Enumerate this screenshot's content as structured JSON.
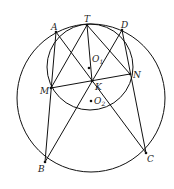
{
  "diagram": {
    "stroke_color": "#111111",
    "big_circle": {
      "name": "O2",
      "cx": 91,
      "cy": 98,
      "r": 74
    },
    "small_circle": {
      "name": "O1",
      "cx": 90,
      "cy": 67,
      "r": 43
    },
    "points": {
      "T": {
        "label": "T",
        "x": 87,
        "y": 25
      },
      "A": {
        "label": "A",
        "x": 56,
        "y": 32
      },
      "D": {
        "label": "D",
        "x": 122,
        "y": 30
      },
      "M": {
        "label": "M",
        "x": 51,
        "y": 88
      },
      "N": {
        "label": "N",
        "x": 130,
        "y": 74
      },
      "K": {
        "label": "K",
        "x": 92,
        "y": 81
      },
      "B": {
        "label": "B",
        "x": 45,
        "y": 162
      },
      "C": {
        "label": "C",
        "x": 146,
        "y": 153
      },
      "O1": {
        "label": "O",
        "sub": "1",
        "x": 89,
        "y": 68
      },
      "O2": {
        "label": "O",
        "sub": "2",
        "x": 91,
        "y": 101
      }
    },
    "segments": [
      [
        "A",
        "B"
      ],
      [
        "A",
        "C"
      ],
      [
        "T",
        "M"
      ],
      [
        "T",
        "K"
      ],
      [
        "T",
        "N"
      ],
      [
        "D",
        "B"
      ],
      [
        "D",
        "C"
      ],
      [
        "M",
        "N"
      ]
    ]
  }
}
